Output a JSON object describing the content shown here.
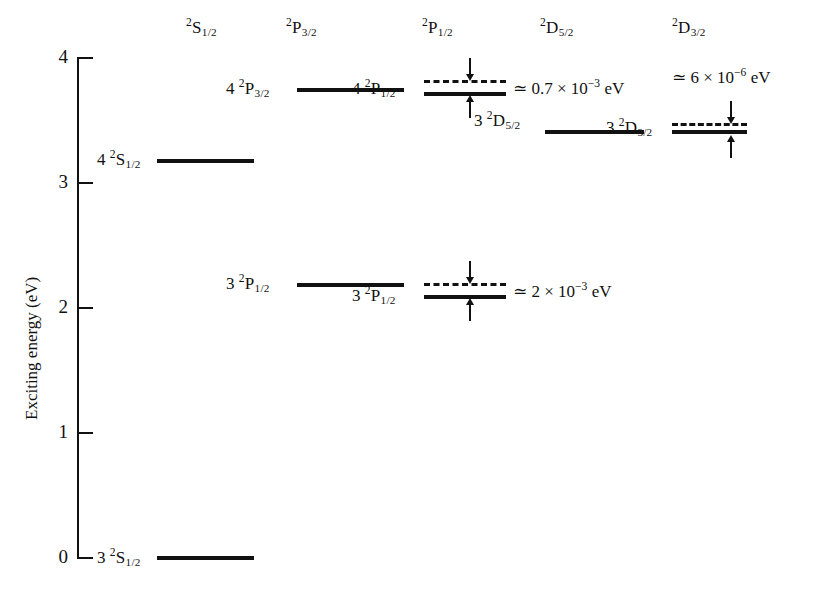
{
  "figure": {
    "type": "energy-level-diagram"
  },
  "yaxis": {
    "title": "Exciting energy (eV)",
    "ticks": [
      "4",
      "3",
      "2",
      "1",
      "0"
    ],
    "tick_values": [
      4,
      3,
      2,
      1,
      0
    ],
    "range": [
      0,
      4
    ],
    "unit": "eV"
  },
  "columns": [
    {
      "id": "s12",
      "header_n": "2",
      "header_letter": "S",
      "header_j": "1/2"
    },
    {
      "id": "p32",
      "header_n": "2",
      "header_letter": "P",
      "header_j": "3/2"
    },
    {
      "id": "p12",
      "header_n": "2",
      "header_letter": "P",
      "header_j": "1/2"
    },
    {
      "id": "d52",
      "header_n": "2",
      "header_letter": "D",
      "header_j": "5/2"
    },
    {
      "id": "d32",
      "header_n": "2",
      "header_letter": "D",
      "header_j": "3/2"
    }
  ],
  "levels": [
    {
      "id": "level-4s",
      "column": "s12",
      "n": "4",
      "letter": "S",
      "j": "1/2",
      "energy_ev": 3.18,
      "label_text": "4"
    },
    {
      "id": "level-3s",
      "column": "s12",
      "n": "3",
      "letter": "S",
      "j": "1/2",
      "energy_ev": 0.0,
      "label_text": "3"
    },
    {
      "id": "level-4p32",
      "column": "p32",
      "n": "4",
      "letter": "P",
      "j": "3/2",
      "energy_ev": 3.75,
      "label_text": "4"
    },
    {
      "id": "level-3p32",
      "column": "p32",
      "n": "3",
      "letter": "P",
      "j": "1/2",
      "energy_ev": 2.19,
      "label_text": "3"
    },
    {
      "id": "level-4p12",
      "column": "p12",
      "n": "4",
      "letter": "P",
      "j": "1/2",
      "energy_ev": 3.72,
      "label_text": "4"
    },
    {
      "id": "level-3p12",
      "column": "p12",
      "n": "3",
      "letter": "P",
      "j": "1/2",
      "energy_ev": 2.1,
      "label_text": "3"
    },
    {
      "id": "level-3d52",
      "column": "d52",
      "n": "3",
      "letter": "D",
      "j": "5/2",
      "energy_ev": 3.42,
      "label_text": "3"
    },
    {
      "id": "level-3d32",
      "column": "d32",
      "n": "3",
      "letter": "D",
      "j": "3/2",
      "energy_ev": 3.42,
      "label_text": "3"
    }
  ],
  "splittings": [
    {
      "id": "splitting-4p",
      "coefficient": "0.7",
      "exponent": "−3",
      "text": "≃ 0.7 × 10⁻³ eV",
      "value_ev": 0.0007
    },
    {
      "id": "splitting-3p",
      "coefficient": "2",
      "exponent": "−3",
      "text": "≃ 2 × 10⁻³ eV",
      "value_ev": 0.002
    },
    {
      "id": "splitting-3d",
      "coefficient": "6",
      "exponent": "−6",
      "text": "≃ 6 × 10⁻⁶ eV",
      "value_ev": 6e-06
    }
  ],
  "labels": {
    "lvl_4s": "4",
    "lvl_3s": "3",
    "lvl_4p32": "4",
    "lvl_3p32": "3",
    "lvl_4p12": "4",
    "lvl_3p12": "3",
    "lvl_3d52": "3",
    "lvl_3d32": "3",
    "annot_4p": "≃ 0.7 × 10",
    "annot_4p_exp": "−3",
    "annot_4p_tail": " eV",
    "annot_3p": "≃ 2 × 10",
    "annot_3p_exp": "−3",
    "annot_3p_tail": " eV",
    "annot_3d": "≃ 6 × 10",
    "annot_3d_exp": "−6",
    "annot_3d_tail": " eV"
  },
  "colors": {
    "ink": "#111111",
    "background": "#ffffff"
  }
}
